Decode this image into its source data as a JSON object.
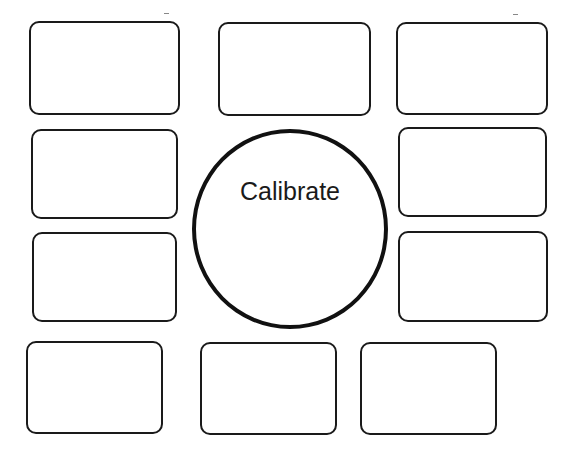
{
  "center": {
    "label": "Calibrate"
  },
  "boxes": [
    {
      "id": "top-left"
    },
    {
      "id": "top-center"
    },
    {
      "id": "top-right"
    },
    {
      "id": "mid-upper-left"
    },
    {
      "id": "mid-upper-right"
    },
    {
      "id": "mid-lower-left"
    },
    {
      "id": "mid-lower-right"
    },
    {
      "id": "bottom-left"
    },
    {
      "id": "bottom-center"
    },
    {
      "id": "bottom-right"
    }
  ],
  "colors": {
    "stroke": "#1a1a1a",
    "background": "#ffffff"
  }
}
